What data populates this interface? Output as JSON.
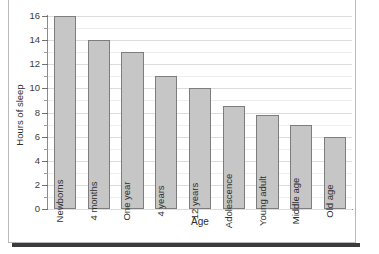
{
  "chart_data": {
    "type": "bar",
    "title": "",
    "xlabel": "Age",
    "ylabel": "Hours of sleep",
    "categories": [
      "Newborns",
      "4 months",
      "One year",
      "4 years",
      "12 years",
      "Adolescence",
      "Young adult",
      "Middle age",
      "Old age"
    ],
    "values": [
      16,
      14,
      13,
      11,
      10,
      8.5,
      7.8,
      7,
      6
    ],
    "ylim": [
      0,
      16
    ],
    "ytick_labels": [
      "0",
      "2",
      "4",
      "6",
      "8",
      "10",
      "12",
      "14",
      "16"
    ],
    "ytick_values": [
      0,
      2,
      4,
      6,
      8,
      10,
      12,
      14,
      16
    ],
    "yminor_step": 1,
    "grid": true,
    "grid_axis": "y",
    "legend": false,
    "bar_fill_color": "#c6c6c6",
    "bar_edge_color": "#7d7d7d",
    "gridline_color": "#dcdcdc",
    "axis_color": "#8a8a8a",
    "label_placement": "inside-bar-rotated"
  }
}
